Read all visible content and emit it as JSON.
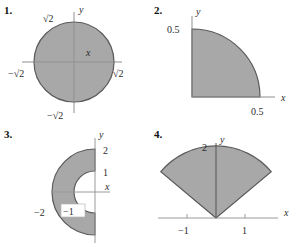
{
  "page": {
    "background_color": "#ffffff",
    "shape_fill": "#a8a8a8",
    "shape_stroke": "#4a4a4a",
    "axis_color": "#8a8a8a",
    "text_color": "#2b2b2b"
  },
  "problems": [
    {
      "number": "1.",
      "shape": "filled-circle",
      "axis_x_label": "x",
      "axis_y_label": "y",
      "labels": {
        "top": "√2",
        "right": "√2",
        "left": "−√2",
        "bottom": "−√2"
      },
      "radius_value": "√2"
    },
    {
      "number": "2.",
      "shape": "quarter-disk-first-quadrant",
      "axis_x_label": "x",
      "axis_y_label": "y",
      "labels": {
        "top": "0.5",
        "right": "0.5"
      },
      "radius_value": "0.5"
    },
    {
      "number": "3.",
      "shape": "left-half-annulus",
      "axis_x_label": "x",
      "axis_y_label": "y",
      "labels": {
        "outer_top": "2",
        "inner_top": "1",
        "outer_left": "−2",
        "inner_left": "−1"
      },
      "outer_radius_value": "2",
      "inner_radius_value": "1"
    },
    {
      "number": "4.",
      "shape": "upward-sector",
      "axis_x_label": "x",
      "axis_y_label": "y",
      "labels": {
        "top": "2",
        "tick_left": "−1",
        "tick_right": "1"
      },
      "radius_value": "2"
    }
  ]
}
